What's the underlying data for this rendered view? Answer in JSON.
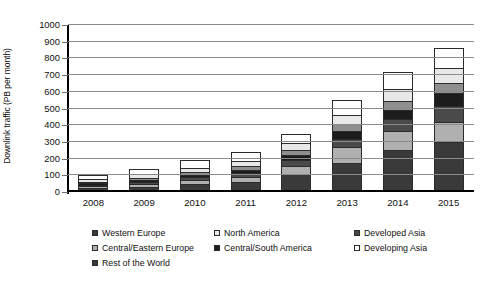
{
  "chart_data": {
    "type": "bar",
    "stacked": true,
    "title": "",
    "xlabel": "",
    "ylabel": "Downlink traffic (PB per month)",
    "categories": [
      "2008",
      "2009",
      "2010",
      "2011",
      "2012",
      "2013",
      "2014",
      "2015"
    ],
    "ylim": [
      0,
      1000
    ],
    "yticks": [
      0,
      100,
      200,
      300,
      400,
      500,
      600,
      700,
      800,
      900,
      1000
    ],
    "grid": true,
    "legend_position": "bottom",
    "stack_order_bottom_to_top": [
      "Western Europe",
      "Central/Eastern Europe",
      "Rest of the World",
      "Central/South America",
      "Developed Asia",
      "North America",
      "Developing Asia"
    ],
    "series": [
      {
        "name": "Western Europe",
        "color": "#3a3a3a",
        "values": [
          22,
          33,
          48,
          60,
          110,
          175,
          250,
          300
        ]
      },
      {
        "name": "Central/Eastern Europe",
        "color": "#b0b0b0",
        "values": [
          12,
          16,
          22,
          30,
          48,
          95,
          115,
          120
        ]
      },
      {
        "name": "Rest of the World",
        "color": "#4a4a4a",
        "values": [
          10,
          13,
          17,
          22,
          32,
          48,
          70,
          95
        ]
      },
      {
        "name": "Central/South America",
        "color": "#1c1c1c",
        "values": [
          9,
          12,
          16,
          20,
          30,
          45,
          58,
          80
        ]
      },
      {
        "name": "Developed Asia",
        "color": "#8f8f8f",
        "values": [
          10,
          13,
          17,
          21,
          30,
          42,
          52,
          60
        ]
      },
      {
        "name": "North America",
        "color": "#e8e8e8",
        "values": [
          14,
          19,
          25,
          30,
          42,
          58,
          72,
          85
        ]
      },
      {
        "name": "Developing Asia",
        "color": "#ffffff",
        "values": [
          28,
          34,
          45,
          57,
          58,
          87,
          103,
          125
        ]
      }
    ],
    "totals": [
      105,
      140,
      190,
      240,
      350,
      550,
      720,
      865
    ]
  },
  "axis": {
    "y_title": "Downlink traffic (PB per month)"
  },
  "legend": {
    "items": [
      {
        "label": "Western Europe",
        "color": "#3a3a3a"
      },
      {
        "label": "North America",
        "color": "#e8e8e8"
      },
      {
        "label": "Developed Asia",
        "color": "#4a4a4a"
      },
      {
        "label": "Central/Eastern Europe",
        "color": "#b0b0b0"
      },
      {
        "label": "Central/South America",
        "color": "#1c1c1c"
      },
      {
        "label": "Developing Asia",
        "color": "#ffffff"
      },
      {
        "label": "Rest of the World",
        "color": "#3a3a3a"
      }
    ]
  }
}
